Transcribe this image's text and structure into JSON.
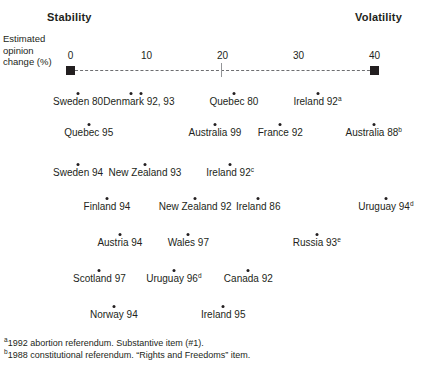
{
  "chart_data": {
    "type": "scatter",
    "title": "",
    "xlabel": "Estimated opinion change (%)",
    "ylabel": "",
    "xlim": [
      0,
      42
    ],
    "ylim": [
      0,
      1
    ],
    "grid": false,
    "legend": null,
    "axis_caption_lines": [
      "Estimated",
      "opinion",
      "change (%)"
    ],
    "pole_left": "Stability",
    "pole_right": "Volatility",
    "xticks": [
      {
        "value": 0,
        "label": "0"
      },
      {
        "value": 10,
        "label": "10"
      },
      {
        "value": 20,
        "label": "20"
      },
      {
        "value": 30,
        "label": "30"
      },
      {
        "value": 40,
        "label": "40"
      }
    ],
    "points": [
      {
        "label": "Sweden 80",
        "x": 1.0,
        "row": 1,
        "footnote": ""
      },
      {
        "label": "Denmark 92, 93",
        "x": 9.0,
        "row": 1,
        "footnote": "",
        "extra_dots": [
          8.0,
          9.3
        ]
      },
      {
        "label": "Quebec 80",
        "x": 21.5,
        "row": 1,
        "footnote": ""
      },
      {
        "label": "Ireland 92",
        "x": 32.5,
        "row": 1,
        "footnote": "a"
      },
      {
        "label": "Quebec 95",
        "x": 2.4,
        "row": 2,
        "footnote": ""
      },
      {
        "label": "Australia 99",
        "x": 19.0,
        "row": 2,
        "footnote": ""
      },
      {
        "label": "France 92",
        "x": 27.6,
        "row": 2,
        "footnote": ""
      },
      {
        "label": "Australia 88",
        "x": 39.9,
        "row": 2,
        "footnote": "b"
      },
      {
        "label": "Sweden 94",
        "x": 1.0,
        "row": 3,
        "footnote": ""
      },
      {
        "label": "New Zealand 93",
        "x": 9.8,
        "row": 3,
        "footnote": ""
      },
      {
        "label": "Ireland 92",
        "x": 21.0,
        "row": 3,
        "footnote": "c"
      },
      {
        "label": "Finland 94",
        "x": 4.8,
        "row": 4,
        "footnote": ""
      },
      {
        "label": "New Zealand 92",
        "x": 16.4,
        "row": 4,
        "footnote": ""
      },
      {
        "label": "Ireland 86",
        "x": 24.7,
        "row": 4,
        "footnote": ""
      },
      {
        "label": "Uruguay 94",
        "x": 41.5,
        "row": 4,
        "footnote": "d"
      },
      {
        "label": "Austria 94",
        "x": 6.5,
        "row": 5,
        "footnote": ""
      },
      {
        "label": "Wales 97",
        "x": 15.5,
        "row": 5,
        "footnote": ""
      },
      {
        "label": "Russia 93",
        "x": 32.4,
        "row": 5,
        "footnote": "e"
      },
      {
        "label": "Scotland 97",
        "x": 3.8,
        "row": 6,
        "footnote": ""
      },
      {
        "label": "Uruguay 96",
        "x": 13.6,
        "row": 6,
        "footnote": "d"
      },
      {
        "label": "Canada 92",
        "x": 23.4,
        "row": 6,
        "footnote": ""
      },
      {
        "label": "Norway 94",
        "x": 5.7,
        "row": 7,
        "footnote": ""
      },
      {
        "label": "Ireland 95",
        "x": 20.1,
        "row": 7,
        "footnote": ""
      }
    ],
    "annotations": [
      {
        "marker": "a",
        "text": "1992 abortion referendum. Substantive item (#1)."
      },
      {
        "marker": "b",
        "text": "1988 constitutional referendum. “Rights and Freedoms” item."
      }
    ]
  },
  "colors": {
    "ink": "#231f20",
    "axis_dash": "#6d6e71",
    "tick": "#939598",
    "background": "#ffffff"
  }
}
